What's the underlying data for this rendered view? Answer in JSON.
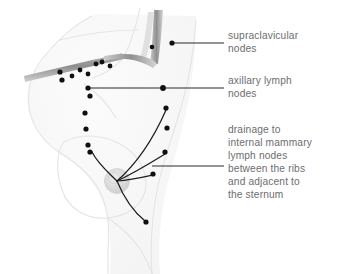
{
  "figure": {
    "background_color": "#ffffff",
    "text_color": "#6d6d70",
    "node_color": "#111111",
    "leader_line_color": "#2b2b2b",
    "bone_color": "#8a8a8a",
    "body_outline_color": "#e6e6e6",
    "tumor_color": "#d8d8d8"
  },
  "labels": {
    "supraclavicular": {
      "text": "supraclavicular\nnodes",
      "lines": [
        "supraclavicular",
        "nodes"
      ]
    },
    "axillary": {
      "text": "axillary lymph\nnodes",
      "lines": [
        "axillary lymph",
        "nodes"
      ]
    },
    "internal_mammary": {
      "text": "drainage to\ninternal mammary\nlymph nodes\nbetween the ribs\nand adjacent to\nthe sternum",
      "lines": [
        "drainage to",
        "internal mammary",
        "lymph nodes",
        "between the ribs",
        "and adjacent to",
        "the sternum"
      ]
    }
  },
  "leader_lines": [
    {
      "name": "leader-supraclavicular",
      "x1": 172,
      "y1": 43,
      "x2": 224,
      "y2": 43
    },
    {
      "name": "leader-axillary",
      "x1": 88,
      "y1": 88,
      "x2": 224,
      "y2": 88
    },
    {
      "name": "leader-internal-mammary",
      "x1": 152,
      "y1": 166,
      "x2": 224,
      "y2": 166
    }
  ],
  "anatomy": {
    "body_outline_path": "M 92 16 C 72 26 54 44 40 62 C 30 76 26 92 30 112 C 34 130 46 144 62 154 C 78 164 92 176 100 192 C 108 208 110 228 108 250 L 108 274",
    "neck_left_path": "M 140 8 C 136 26 132 42 124 56 C 116 68 104 74 92 78",
    "torso_right_path": "M 196 20 C 194 48 190 76 182 104 C 174 132 164 158 158 186 C 152 214 150 244 152 274",
    "breast_path": "M 64 142 C 78 134 98 134 116 142 C 134 150 146 166 146 184 C 146 202 130 216 108 218 C 86 220 68 208 62 190 C 56 172 56 152 64 142",
    "waist_path": "M 108 218 C 122 226 136 238 144 254 C 150 264 152 270 152 274",
    "clavicle_path": "M 26 74 C 46 70 70 64 92 60 C 104 58 112 56 118 54",
    "neck_muscle_path": "M 158 14 C 156 32 154 48 152 62",
    "shoulder_band_path": "M 106 54 C 122 52 136 52 148 56 C 154 58 156 60 156 62"
  },
  "tumor": {
    "name": "primary-tumor",
    "cx": 117,
    "cy": 181,
    "r": 12.5
  },
  "lymph_nodes": [
    {
      "name": "node-supraclavicular-1",
      "cx": 172,
      "cy": 43,
      "r": 2.6
    },
    {
      "name": "node-supraclavicular-2",
      "cx": 152,
      "cy": 47,
      "r": 2.3
    },
    {
      "name": "node-clavicle-1",
      "cx": 60,
      "cy": 72,
      "r": 2.6
    },
    {
      "name": "node-clavicle-2",
      "cx": 62,
      "cy": 80,
      "r": 2.6
    },
    {
      "name": "node-clavicle-3",
      "cx": 72,
      "cy": 76,
      "r": 2.4
    },
    {
      "name": "node-clavicle-4",
      "cx": 80,
      "cy": 70,
      "r": 2.4
    },
    {
      "name": "node-clavicle-5",
      "cx": 88,
      "cy": 74,
      "r": 2.4
    },
    {
      "name": "node-clavicle-6",
      "cx": 96,
      "cy": 64,
      "r": 2.4
    },
    {
      "name": "node-clavicle-7",
      "cx": 102,
      "cy": 62,
      "r": 2.4
    },
    {
      "name": "node-clavicle-8",
      "cx": 110,
      "cy": 66,
      "r": 2.4
    },
    {
      "name": "node-axillary-apex",
      "cx": 163,
      "cy": 88,
      "r": 2.9
    },
    {
      "name": "node-axillary-chain-1",
      "cx": 88,
      "cy": 88,
      "r": 2.6
    },
    {
      "name": "node-axillary-chain-2",
      "cx": 90,
      "cy": 96,
      "r": 2.6
    },
    {
      "name": "node-axillary-chain-3",
      "cx": 85,
      "cy": 113,
      "r": 2.6
    },
    {
      "name": "node-axillary-chain-4",
      "cx": 86,
      "cy": 129,
      "r": 2.6
    },
    {
      "name": "node-axillary-chain-5",
      "cx": 88,
      "cy": 145,
      "r": 2.6
    },
    {
      "name": "node-axillary-chain-6",
      "cx": 90,
      "cy": 152,
      "r": 2.6
    },
    {
      "name": "node-internal-mammary-1",
      "cx": 166,
      "cy": 108,
      "r": 2.6
    },
    {
      "name": "node-internal-mammary-2",
      "cx": 167,
      "cy": 128,
      "r": 2.6
    },
    {
      "name": "node-internal-mammary-3",
      "cx": 165,
      "cy": 152,
      "r": 2.6
    },
    {
      "name": "node-internal-mammary-4",
      "cx": 153,
      "cy": 174,
      "r": 2.6
    },
    {
      "name": "node-inferior-terminus",
      "cx": 146,
      "cy": 222,
      "r": 2.6
    }
  ],
  "drainage_paths": [
    {
      "name": "drainage-path-axillary",
      "d": "M 117 181 C 108 172 98 164 92 152"
    },
    {
      "name": "drainage-path-im-1",
      "d": "M 117 181 C 134 166 152 142 166 110"
    },
    {
      "name": "drainage-path-im-2",
      "d": "M 117 181 C 136 172 152 162 165 154"
    },
    {
      "name": "drainage-path-im-3",
      "d": "M 117 181 C 132 180 144 177 153 175"
    },
    {
      "name": "drainage-path-inferior",
      "d": "M 117 181 C 124 198 134 212 145 221"
    }
  ]
}
